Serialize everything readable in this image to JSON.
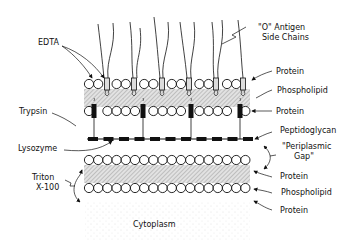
{
  "diagram": {
    "labels": {
      "o_antigen_line1": "\"O\"  Antigen",
      "o_antigen_line2": "Side Chains",
      "edta": "EDTA",
      "trypsin": "Trypsin",
      "lysozyme": "Lysozyme",
      "triton_line1": "Triton",
      "triton_line2": "X-100",
      "outer_protein_top": "Protein",
      "outer_phospholipid": "Phospholipid",
      "outer_protein_bottom": "Protein",
      "peptidoglycan": "Peptidoglycan",
      "periplasmic_line1": "\"Periplasmic",
      "periplasmic_line2": "Gap\"",
      "inner_protein_top": "Protein",
      "inner_phospholipid": "Phospholipid",
      "inner_protein_bottom": "Protein",
      "cytoplasm": "Cytoplasm"
    },
    "colors": {
      "ink": "#111111",
      "hatch": "#bbbbbb",
      "background": "#ffffff"
    }
  }
}
